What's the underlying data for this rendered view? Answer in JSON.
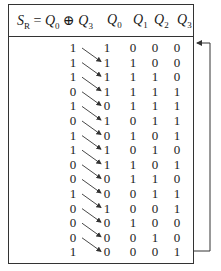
{
  "header": {
    "sr_label": "S",
    "sr_sub": "R",
    "sr_eq": " = ",
    "q0": "Q",
    "q0_sub": "0",
    "xor": " ⊕ ",
    "q3": "Q",
    "q3_sub": "3",
    "columns": [
      {
        "label": "Q",
        "sub": "0"
      },
      {
        "label": "Q",
        "sub": "1"
      },
      {
        "label": "Q",
        "sub": "2"
      },
      {
        "label": "Q",
        "sub": "3"
      }
    ]
  },
  "rows": [
    {
      "sr": "1",
      "q": [
        "1",
        "0",
        "0",
        "0"
      ]
    },
    {
      "sr": "1",
      "q": [
        "1",
        "1",
        "0",
        "0"
      ]
    },
    {
      "sr": "1",
      "q": [
        "1",
        "1",
        "1",
        "0"
      ]
    },
    {
      "sr": "0",
      "q": [
        "1",
        "1",
        "1",
        "1"
      ]
    },
    {
      "sr": "1",
      "q": [
        "0",
        "1",
        "1",
        "1"
      ]
    },
    {
      "sr": "0",
      "q": [
        "1",
        "0",
        "1",
        "1"
      ]
    },
    {
      "sr": "1",
      "q": [
        "0",
        "1",
        "0",
        "1"
      ]
    },
    {
      "sr": "1",
      "q": [
        "1",
        "0",
        "1",
        "0"
      ]
    },
    {
      "sr": "0",
      "q": [
        "1",
        "1",
        "0",
        "1"
      ]
    },
    {
      "sr": "0",
      "q": [
        "0",
        "1",
        "1",
        "0"
      ]
    },
    {
      "sr": "1",
      "q": [
        "0",
        "0",
        "1",
        "1"
      ]
    },
    {
      "sr": "0",
      "q": [
        "1",
        "0",
        "0",
        "1"
      ]
    },
    {
      "sr": "0",
      "q": [
        "0",
        "1",
        "0",
        "0"
      ]
    },
    {
      "sr": "0",
      "q": [
        "0",
        "0",
        "1",
        "0"
      ]
    },
    {
      "sr": "1",
      "q": [
        "0",
        "0",
        "0",
        "1"
      ]
    }
  ],
  "colors": {
    "line": "#333333",
    "text": "#1a1a1a"
  }
}
